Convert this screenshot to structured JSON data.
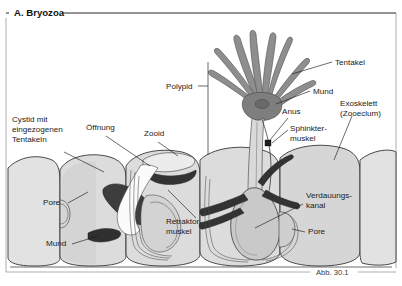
{
  "figure": {
    "title": "A. Bryozoa",
    "caption": "Abb. 30.1",
    "background_color": "#ffffff",
    "frame_color": "#9a9a9a",
    "text_color": "#1a1a1a"
  },
  "palette": {
    "body_wall_fill": "#dcdcdc",
    "body_wall_fill_light": "#e8e8e8",
    "body_wall_fill_dark": "#cfcfcf",
    "tentacle_fill": "#8e8e8e",
    "muscle_dark": "#3a3a3a",
    "muscle_darker": "#2a2a2a",
    "gut_fill": "#c8c8c8",
    "outline": "#2b2b2b",
    "leader": "#1a1a1a"
  },
  "labels": [
    {
      "id": "cystid",
      "text_lines": [
        "Cystid mit",
        "eingezogenen",
        "Tentakeln"
      ],
      "x": 12,
      "y": 122,
      "anchor": "start"
    },
    {
      "id": "oeffnung",
      "text_lines": [
        "Öffnung"
      ],
      "x": 86,
      "y": 130,
      "anchor": "start"
    },
    {
      "id": "zooid",
      "text_lines": [
        "Zooid"
      ],
      "x": 144,
      "y": 136,
      "anchor": "start"
    },
    {
      "id": "polypid",
      "text_lines": [
        "Polypid"
      ],
      "x": 166,
      "y": 89,
      "anchor": "start"
    },
    {
      "id": "tentakel",
      "text_lines": [
        "Tentakel"
      ],
      "x": 335,
      "y": 65,
      "anchor": "start"
    },
    {
      "id": "mund-rechts",
      "text_lines": [
        "Mund"
      ],
      "x": 313,
      "y": 94,
      "anchor": "start"
    },
    {
      "id": "anus",
      "text_lines": [
        "Anus"
      ],
      "x": 287,
      "y": 114,
      "anchor": "start"
    },
    {
      "id": "sphinkter",
      "text_lines": [
        "Sphinkter-",
        "muskel"
      ],
      "x": 290,
      "y": 131,
      "anchor": "start"
    },
    {
      "id": "exoskelett",
      "text_lines": [
        "Exoskelett",
        "(Zooecium)"
      ],
      "x": 340,
      "y": 106,
      "anchor": "start"
    },
    {
      "id": "verdauungs",
      "text_lines": [
        "Verdauungs-",
        "kanal"
      ],
      "x": 306,
      "y": 198,
      "anchor": "start"
    },
    {
      "id": "pore-rechts",
      "text_lines": [
        "Pore"
      ],
      "x": 308,
      "y": 234,
      "anchor": "start"
    },
    {
      "id": "pore-links",
      "text_lines": [
        "Pore"
      ],
      "x": 43,
      "y": 205,
      "anchor": "start"
    },
    {
      "id": "mund-links",
      "text_lines": [
        "Mund"
      ],
      "x": 46,
      "y": 246,
      "anchor": "start"
    },
    {
      "id": "retraktor",
      "text_lines": [
        "Retraktor-",
        "muskel"
      ],
      "x": 168,
      "y": 224,
      "anchor": "start"
    }
  ],
  "structures": [
    {
      "id": "zooid-chamber-left-outer",
      "name": "exoskeleton-chamber"
    },
    {
      "id": "zooid-chamber-left",
      "name": "exoskeleton-chamber"
    },
    {
      "id": "zooid-chamber-center",
      "name": "retracted-zooid-chamber"
    },
    {
      "id": "zooid-chamber-right",
      "name": "expanded-zooid-chamber"
    },
    {
      "id": "zooid-chamber-far-right",
      "name": "exoskeleton-chamber"
    },
    {
      "id": "tentacle-crown",
      "name": "lophophore-tentacle-crown",
      "tentacle_count": 8
    },
    {
      "id": "digestive-tract",
      "name": "digestive-canal-stomach"
    },
    {
      "id": "retractor-muscle",
      "name": "retractor-muscle-band"
    },
    {
      "id": "sphincter-muscle",
      "name": "sphincter-muscle"
    },
    {
      "id": "retracted-polypid",
      "name": "retracted-polypid-mass"
    }
  ]
}
